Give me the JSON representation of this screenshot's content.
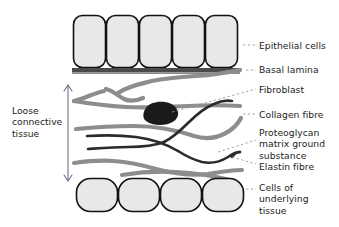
{
  "diagram": {
    "background_color": "#ffffff",
    "text_color": "#1c1c1c",
    "colors": {
      "cell_fill": "#e8e8e8",
      "cell_stroke": "#111111",
      "basal_lamina": "#4a4a4a",
      "collagen_fibre": "#8d8d8d",
      "elastin_fibre": "#2b2b2b",
      "fibroblast": "#1a1a1a",
      "leader_line": "#9a9a9a",
      "span_arrow": "#6e6e8a"
    },
    "labels": {
      "epithelial_cells": "Epithelial cells",
      "basal_lamina": "Basal lamina",
      "fibroblast": "Fibroblast",
      "collagen_fibre": "Collagen fibre",
      "proteoglycan_line1": "Proteoglycan",
      "proteoglycan_line2": "matrix ground",
      "proteoglycan_line3": "substance",
      "elastin_fibre": "Elastin fibre",
      "cells_underlying_line1": "Cells of",
      "cells_underlying_line2": "underlying",
      "cells_underlying_line3": "tissue",
      "loose_line1": "Loose",
      "loose_line2": "connective",
      "loose_line3": "tissue"
    },
    "structures": {
      "epithelial_cell_count": 5,
      "underlying_cell_count": 4,
      "collagen_fibre_count": 6,
      "elastin_fibre_count": 3,
      "fibroblast_count": 1
    }
  }
}
